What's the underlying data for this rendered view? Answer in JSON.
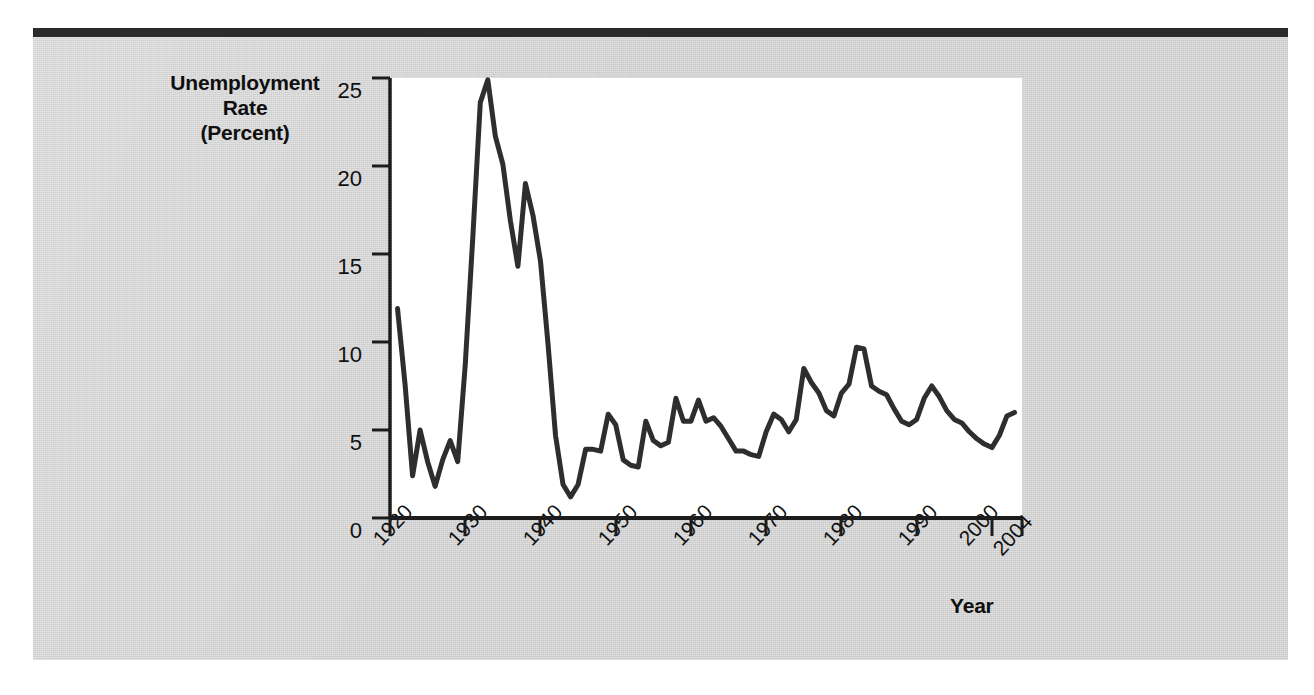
{
  "page": {
    "background_color": "#d2d2d2",
    "rule_color": "#2b2b2b",
    "plot_background": "#ffffff",
    "line_color": "#2e2e2e"
  },
  "axes": {
    "y_title_lines": [
      "Unemployment",
      "Rate",
      "(Percent)"
    ],
    "y_title_text": "Unemployment Rate (Percent)",
    "x_title": "Year",
    "y_ticks": [
      "0",
      "5",
      "10",
      "15",
      "20",
      "25"
    ],
    "x_ticks": [
      "1920",
      "1930",
      "1940",
      "1950",
      "1960",
      "1970",
      "1980",
      "1990",
      "2000",
      "2004"
    ]
  },
  "chart_data": {
    "type": "line",
    "title": "",
    "xlabel": "Year",
    "ylabel": "Unemployment Rate (Percent)",
    "xlim": [
      1920,
      2004
    ],
    "ylim": [
      0,
      25
    ],
    "grid": false,
    "legend": "none",
    "yticks": [
      0,
      5,
      10,
      15,
      20,
      25
    ],
    "xticks": [
      1920,
      1930,
      1940,
      1950,
      1960,
      1970,
      1980,
      1990,
      2000,
      2004
    ],
    "series": [
      {
        "name": "Unemployment Rate",
        "x": [
          1921,
          1922,
          1923,
          1924,
          1925,
          1926,
          1927,
          1928,
          1929,
          1930,
          1931,
          1932,
          1933,
          1934,
          1935,
          1936,
          1937,
          1938,
          1939,
          1940,
          1941,
          1942,
          1943,
          1944,
          1945,
          1946,
          1947,
          1948,
          1949,
          1950,
          1951,
          1952,
          1953,
          1954,
          1955,
          1956,
          1957,
          1958,
          1959,
          1960,
          1961,
          1962,
          1963,
          1964,
          1965,
          1966,
          1967,
          1968,
          1969,
          1970,
          1971,
          1972,
          1973,
          1974,
          1975,
          1976,
          1977,
          1978,
          1979,
          1980,
          1981,
          1982,
          1983,
          1984,
          1985,
          1986,
          1987,
          1988,
          1989,
          1990,
          1991,
          1992,
          1993,
          1994,
          1995,
          1996,
          1997,
          1998,
          1999,
          2000,
          2001,
          2002,
          2003
        ],
        "values": [
          11.9,
          7.6,
          2.4,
          5.0,
          3.2,
          1.8,
          3.3,
          4.4,
          3.2,
          8.7,
          15.9,
          23.6,
          24.9,
          21.7,
          20.1,
          16.9,
          14.3,
          19.0,
          17.2,
          14.6,
          9.9,
          4.7,
          1.9,
          1.2,
          1.9,
          3.9,
          3.9,
          3.8,
          5.9,
          5.3,
          3.3,
          3.0,
          2.9,
          5.5,
          4.4,
          4.1,
          4.3,
          6.8,
          5.5,
          5.5,
          6.7,
          5.5,
          5.7,
          5.2,
          4.5,
          3.8,
          3.8,
          3.6,
          3.5,
          4.9,
          5.9,
          5.6,
          4.9,
          5.6,
          8.5,
          7.7,
          7.1,
          6.1,
          5.8,
          7.1,
          7.6,
          9.7,
          9.6,
          7.5,
          7.2,
          7.0,
          6.2,
          5.5,
          5.3,
          5.6,
          6.8,
          7.5,
          6.9,
          6.1,
          5.6,
          5.4,
          4.9,
          4.5,
          4.2,
          4.0,
          4.7,
          5.8,
          6.0
        ]
      }
    ]
  }
}
